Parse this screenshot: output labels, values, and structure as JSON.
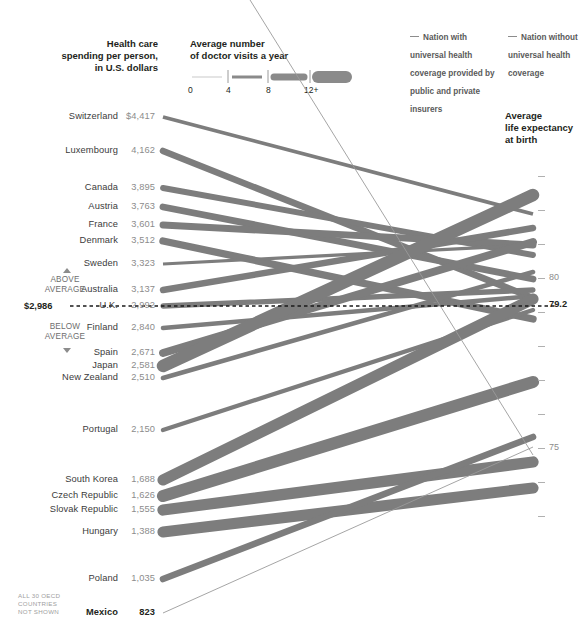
{
  "header": {
    "spending_title": "Health care\nspending per person,\nin U.S. dollars",
    "visits_title": "Average number\nof doctor visits a year",
    "scale_ticks": [
      "0",
      "4",
      "8",
      "12+"
    ],
    "legend_universal": "Nation with universal health coverage provided by public and private insurers",
    "legend_no_universal": "Nation without universal health coverage"
  },
  "right_axis": {
    "title": "Average\nlife expectancy\nat birth",
    "labels": [
      {
        "text": "80",
        "value": 80
      },
      {
        "text": "79.2",
        "value": 79.2,
        "highlight": true
      },
      {
        "text": "75",
        "value": 75
      }
    ]
  },
  "average_marker": {
    "above_label": "ABOVE\nAVERAGE",
    "below_label": "BELOW\nAVERAGE",
    "spending_amount": "$2,986",
    "life_expectancy": "79.2"
  },
  "footnote": "ALL 30 OECD\nCOUNTRIES\nNOT SHOWN",
  "chart_data": {
    "type": "line",
    "xlabel": "",
    "ylabel_left": "Health care spending per person, in U.S. dollars",
    "ylabel_right": "Average life expectancy at birth",
    "legend_position": "top-right",
    "grid": false,
    "left_axis_range": [
      823,
      4417
    ],
    "right_axis_range": [
      71.5,
      83.2
    ],
    "average_spending": 2986,
    "average_life_expectancy": 79.2,
    "series": [
      {
        "name": "Switzerland",
        "spending": 4417,
        "spending_label": "$4,417",
        "life_expectancy": 81.9,
        "doctor_visits": 3.4,
        "universal": true,
        "y_left": 117,
        "y_right": 214
      },
      {
        "name": "Luxembourg",
        "spending": 4162,
        "spending_label": "4,162",
        "life_expectancy": 79.4,
        "doctor_visits": 6.6,
        "universal": true,
        "y_left": 151,
        "y_right": 298
      },
      {
        "name": "Canada",
        "spending": 3895,
        "spending_label": "3,895",
        "life_expectancy": 80.7,
        "doctor_visits": 5.8,
        "universal": true,
        "y_left": 188,
        "y_right": 255
      },
      {
        "name": "Austria",
        "spending": 3763,
        "spending_label": "3,763",
        "life_expectancy": 80.0,
        "doctor_visits": 6.9,
        "universal": true,
        "y_left": 207,
        "y_right": 279
      },
      {
        "name": "France",
        "spending": 3601,
        "spending_label": "3,601",
        "life_expectancy": 81.0,
        "doctor_visits": 6.9,
        "universal": true,
        "y_left": 225,
        "y_right": 245
      },
      {
        "name": "Denmark",
        "spending": 3512,
        "spending_label": "3,512",
        "life_expectancy": 78.8,
        "doctor_visits": 7.5,
        "universal": true,
        "y_left": 241,
        "y_right": 319
      },
      {
        "name": "Sweden",
        "spending": 3323,
        "spending_label": "3,323",
        "life_expectancy": 81.0,
        "doctor_visits": 2.8,
        "universal": true,
        "y_left": 264,
        "y_right": 245
      },
      {
        "name": "Australia",
        "spending": 3137,
        "spending_label": "3,137",
        "life_expectancy": 81.5,
        "doctor_visits": 6.5,
        "universal": true,
        "y_left": 290,
        "y_right": 228
      },
      {
        "name": "U.K.",
        "spending": 2992,
        "spending_label": "2,992",
        "life_expectancy": 79.7,
        "doctor_visits": 5.1,
        "universal": true,
        "y_left": 306,
        "y_right": 290
      },
      {
        "name": "Finland",
        "spending": 2840,
        "spending_label": "2,840",
        "life_expectancy": 79.5,
        "doctor_visits": 4.2,
        "universal": true,
        "y_left": 328,
        "y_right": 296
      },
      {
        "name": "Spain",
        "spending": 2671,
        "spending_label": "2,671",
        "life_expectancy": 81.1,
        "doctor_visits": 8.1,
        "universal": true,
        "y_left": 353,
        "y_right": 242
      },
      {
        "name": "Japan",
        "spending": 2581,
        "spending_label": "2,581",
        "life_expectancy": 82.6,
        "doctor_visits": 13.6,
        "universal": true,
        "y_left": 366,
        "y_right": 195
      },
      {
        "name": "New Zealand",
        "spending": 2510,
        "spending_label": "2,510",
        "life_expectancy": 80.2,
        "doctor_visits": 4.3,
        "universal": true,
        "y_left": 378,
        "y_right": 272
      },
      {
        "name": "Portugal",
        "spending": 2150,
        "spending_label": "2,150",
        "life_expectancy": 79.1,
        "doctor_visits": 4.0,
        "universal": true,
        "y_left": 430,
        "y_right": 310
      },
      {
        "name": "South Korea",
        "spending": 1688,
        "spending_label": "1,688",
        "life_expectancy": 79.4,
        "doctor_visits": 11.8,
        "universal": true,
        "y_left": 480,
        "y_right": 299
      },
      {
        "name": "Czech Republic",
        "spending": 1626,
        "spending_label": "1,626",
        "life_expectancy": 77.0,
        "doctor_visits": 13.0,
        "universal": true,
        "y_left": 496,
        "y_right": 382
      },
      {
        "name": "Slovak Republic",
        "spending": 1555,
        "spending_label": "1,555",
        "life_expectancy": 74.6,
        "doctor_visits": 12.0,
        "universal": true,
        "y_left": 510,
        "y_right": 462
      },
      {
        "name": "Hungary",
        "spending": 1388,
        "spending_label": "1,388",
        "life_expectancy": 73.8,
        "doctor_visits": 11.8,
        "universal": true,
        "y_left": 532,
        "y_right": 488
      },
      {
        "name": "Poland",
        "spending": 1035,
        "spending_label": "1,035",
        "life_expectancy": 75.5,
        "doctor_visits": 6.6,
        "universal": true,
        "y_left": 579,
        "y_right": 437
      },
      {
        "name": "Mexico",
        "spending": 823,
        "spending_label": "823",
        "life_expectancy": 75.1,
        "doctor_visits": 2.5,
        "universal": false,
        "y_left": 613,
        "y_right": 447,
        "highlight": true
      },
      {
        "name": "United States",
        "spending": 7290,
        "spending_label": "",
        "life_expectancy": 78.1,
        "doctor_visits": 3.8,
        "universal": false,
        "y_left": -140,
        "y_right": 455
      }
    ]
  },
  "colors": {
    "line": "#7d7d7d",
    "line_light": "#b9b9b9",
    "text_dark": "#231f20",
    "text_mid": "#5a5a5a",
    "text_light": "#8c8c8c"
  }
}
